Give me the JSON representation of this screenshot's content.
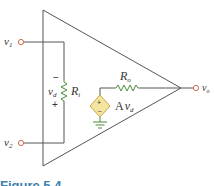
{
  "diagram": {
    "type": "op-amp equivalent circuit",
    "terminals": {
      "input1": "v",
      "input1_sub": "1",
      "input2": "v",
      "input2_sub": "2",
      "output": "v",
      "output_sub": "o"
    },
    "input_resistor": {
      "label": "R",
      "label_sub": "i",
      "voltage_label": "v",
      "voltage_sub": "d",
      "minus": "−",
      "plus": "+"
    },
    "output_resistor": {
      "label": "R",
      "label_sub": "o"
    },
    "dependent_source": {
      "label_prefix": "A",
      "label_var": "v",
      "label_sub": "d",
      "plus": "+",
      "minus": "−"
    },
    "colors": {
      "wire": "#555555",
      "resistor": "#4a8a3a",
      "source_fill": "#f5e3a0",
      "source_stroke": "#c8a64a",
      "ground": "#4a8a3a",
      "terminal": "#d46a4a",
      "caption": "#3a7fb0"
    }
  },
  "caption": {
    "text": "Figure 5.4"
  }
}
